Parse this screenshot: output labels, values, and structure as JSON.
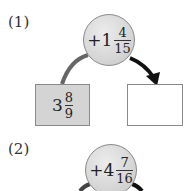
{
  "problems": [
    {
      "label": "(1)",
      "operator": {
        "sign": "+",
        "whole": "1",
        "numerator": "4",
        "denominator": "15"
      },
      "start": {
        "whole": "3",
        "numerator": "8",
        "denominator": "9"
      },
      "answer": ""
    },
    {
      "label": "(2)",
      "operator": {
        "sign": "+",
        "whole": "4",
        "numerator": "7",
        "denominator": "16"
      }
    }
  ],
  "colors": {
    "given_box_fill": "#d4d4d4",
    "circle_fill": "#d6d6d6",
    "arc_left": "#666666",
    "arc_right": "#111111"
  }
}
